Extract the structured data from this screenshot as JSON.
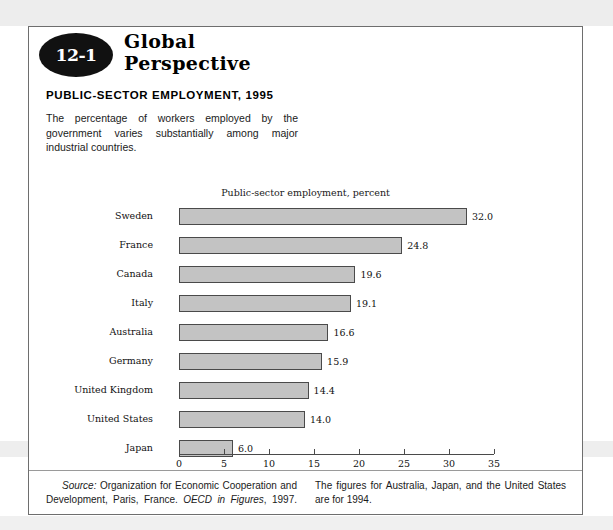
{
  "badge": {
    "number": "12-1"
  },
  "series_title_line1": "Global",
  "series_title_line2": "Perspective",
  "headline": "PUBLIC-SECTOR EMPLOYMENT, 1995",
  "lede": "The percentage of workers employed by the government varies substantially among major industrial countries.",
  "source_note": {
    "label": "Source:",
    "text_part1": " Organization for Economic Cooperation and Development, Paris, France. ",
    "italic_title": "OECD in Figures",
    "text_part2": ", 1997. The figures for Australia, Japan, and the United States are for 1994."
  },
  "colors": {
    "bar_fill": "#c3c3c3",
    "bar_border": "#4a4a4a",
    "frame": "#6e6e6e",
    "badge": "#111111"
  },
  "chart_data": {
    "type": "bar",
    "orientation": "horizontal",
    "title": "Public-sector employment, percent",
    "xlabel": "",
    "ylabel": "",
    "xlim": [
      0,
      35
    ],
    "xticks": [
      0,
      5,
      10,
      15,
      20,
      25,
      30,
      35
    ],
    "xtick_labels": [
      "0",
      "5",
      "10",
      "15",
      "20",
      "25",
      "30",
      "35"
    ],
    "grid": false,
    "legend": false,
    "categories": [
      "Sweden",
      "France",
      "Canada",
      "Italy",
      "Australia",
      "Germany",
      "United Kingdom",
      "United States",
      "Japan"
    ],
    "values": [
      32.0,
      24.8,
      19.6,
      19.1,
      16.6,
      15.9,
      14.4,
      14.0,
      6.0
    ],
    "value_labels": [
      "32.0",
      "24.8",
      "19.6",
      "19.1",
      "16.6",
      "15.9",
      "14.4",
      "14.0",
      "6.0"
    ]
  }
}
